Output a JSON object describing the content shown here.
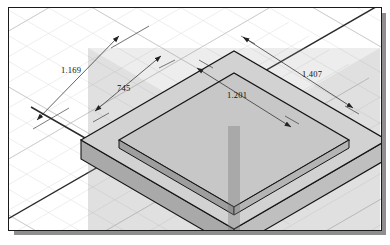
{
  "app": {
    "view_type": "isometric-cad-viewport",
    "background_color": "#ffffff",
    "frame_border_color": "#1a1a1a",
    "frame_shadow_color": "#8e8e8e"
  },
  "grid": {
    "type": "isometric",
    "minor_line_color": "#d8d8d8",
    "major_line_color": "#bdbdbd",
    "axis_line_color": "#2a2a2a",
    "visible": true
  },
  "model": {
    "name": "rectangular-plate",
    "top_face_color": "#d4d4d4",
    "front_left_face_color": "#a8a8a8",
    "front_right_face_color": "#bcbcbc",
    "inner_pocket_color": "#c6c6c6",
    "edge_color": "#151515",
    "overlay_color": "rgba(140,140,140,0.30)"
  },
  "dimensions": [
    {
      "id": "dim-1169",
      "value": "1.169",
      "edge": "rear-left-overall"
    },
    {
      "id": "dim-745",
      "value": "745",
      "edge": "rear-left-inner"
    },
    {
      "id": "dim-1201",
      "value": "1.201",
      "edge": "rear-right-inner"
    },
    {
      "id": "dim-1407",
      "value": "1.407",
      "edge": "rear-right-overall"
    }
  ],
  "dimension_style": {
    "line_color": "#222222",
    "text_color": "#111111",
    "arrowheads": "filled-closed"
  }
}
